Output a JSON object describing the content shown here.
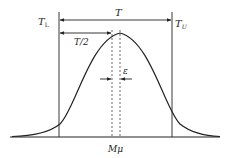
{
  "diagram": {
    "type": "normal-distribution-tolerance",
    "labels": {
      "lower_limit": "T",
      "lower_limit_sub": "L",
      "upper_limit": "T",
      "upper_limit_sub": "U",
      "tolerance": "T",
      "half_tolerance": "T/2",
      "offset": "ε",
      "center": "Mμ"
    },
    "colors": {
      "stroke": "#222222",
      "background": "#ffffff"
    }
  }
}
